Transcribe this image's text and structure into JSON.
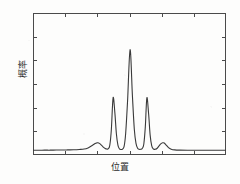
{
  "figure": {
    "background_color": "#fdfdfc",
    "frame_color": "#4a4a4a",
    "curve_color": "#3a3a3a"
  },
  "axes": {
    "ylabel": "概率",
    "xlabel": "位置"
  },
  "chart_data": {
    "type": "line",
    "title": "",
    "xlabel": "位置",
    "ylabel": "概率",
    "xlim": [
      0,
      1
    ],
    "ylim": [
      0,
      1
    ],
    "grid": false,
    "legend": null,
    "tick_labels_x": [],
    "tick_labels_y": [],
    "n_ticks_x": 5,
    "n_ticks_y": 5,
    "peaks": [
      {
        "name": "outer-left",
        "x": 0.336,
        "y": 0.086
      },
      {
        "name": "inner-left",
        "x": 0.415,
        "y": 0.403
      },
      {
        "name": "central",
        "x": 0.503,
        "y": 0.742
      },
      {
        "name": "inner-right",
        "x": 0.59,
        "y": 0.403
      },
      {
        "name": "outer-right",
        "x": 0.672,
        "y": 0.086
      }
    ],
    "baseline": 0.035,
    "x": [
      0.0,
      0.03,
      0.06,
      0.09,
      0.12,
      0.15,
      0.18,
      0.21,
      0.24,
      0.265,
      0.285,
      0.3,
      0.312,
      0.322,
      0.33,
      0.336,
      0.344,
      0.354,
      0.364,
      0.374,
      0.382,
      0.39,
      0.398,
      0.406,
      0.415,
      0.424,
      0.432,
      0.44,
      0.448,
      0.456,
      0.464,
      0.472,
      0.48,
      0.49,
      0.503,
      0.515,
      0.525,
      0.534,
      0.542,
      0.55,
      0.558,
      0.566,
      0.574,
      0.582,
      0.59,
      0.599,
      0.607,
      0.615,
      0.623,
      0.632,
      0.642,
      0.652,
      0.662,
      0.672,
      0.68,
      0.69,
      0.702,
      0.716,
      0.734,
      0.76,
      0.8,
      0.85,
      0.9,
      0.95,
      1.0
    ],
    "y": [
      0.033,
      0.033,
      0.034,
      0.034,
      0.035,
      0.035,
      0.036,
      0.037,
      0.039,
      0.042,
      0.05,
      0.062,
      0.072,
      0.081,
      0.085,
      0.086,
      0.082,
      0.07,
      0.056,
      0.046,
      0.042,
      0.044,
      0.07,
      0.18,
      0.403,
      0.3,
      0.15,
      0.07,
      0.043,
      0.039,
      0.042,
      0.06,
      0.15,
      0.38,
      0.742,
      0.42,
      0.18,
      0.08,
      0.048,
      0.04,
      0.04,
      0.046,
      0.076,
      0.2,
      0.403,
      0.29,
      0.14,
      0.066,
      0.043,
      0.04,
      0.046,
      0.062,
      0.078,
      0.086,
      0.084,
      0.07,
      0.052,
      0.041,
      0.036,
      0.034,
      0.033,
      0.033,
      0.033,
      0.033,
      0.033
    ]
  }
}
